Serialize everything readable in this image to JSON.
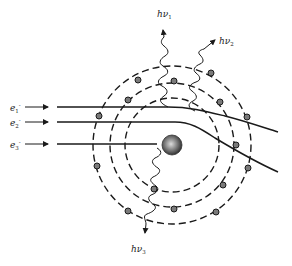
{
  "diagram": {
    "nucleus": {
      "cx": 172,
      "cy": 145,
      "r": 10
    },
    "orbits": [
      {
        "name": "inner-orbit",
        "r": 47
      },
      {
        "name": "middle-orbit",
        "r": 62
      },
      {
        "name": "outer-orbit",
        "r": 79
      }
    ],
    "orbital_electrons": [
      {
        "x": 138,
        "y": 80
      },
      {
        "x": 174,
        "y": 81
      },
      {
        "x": 211,
        "y": 73
      },
      {
        "x": 128,
        "y": 100
      },
      {
        "x": 220,
        "y": 102
      },
      {
        "x": 99,
        "y": 116
      },
      {
        "x": 247,
        "y": 117
      },
      {
        "x": 236,
        "y": 145
      },
      {
        "x": 97,
        "y": 166
      },
      {
        "x": 248,
        "y": 168
      },
      {
        "x": 154,
        "y": 189
      },
      {
        "x": 223,
        "y": 185
      },
      {
        "x": 128,
        "y": 211
      },
      {
        "x": 174,
        "y": 209
      },
      {
        "x": 216,
        "y": 212
      }
    ],
    "incident_electrons": [
      {
        "label": "e",
        "sub": "1",
        "sup": "-",
        "y": 107
      },
      {
        "label": "e",
        "sub": "2",
        "sup": "-",
        "y": 122
      },
      {
        "label": "e",
        "sub": "3",
        "sup": "-",
        "y": 144
      }
    ],
    "photons": [
      {
        "label": "hν",
        "sub": "1"
      },
      {
        "label": "hν",
        "sub": "2"
      },
      {
        "label": "hν",
        "sub": "3"
      }
    ],
    "colors": {
      "line": "#1a1a1a",
      "electron_fill": "#7a7a7a",
      "nucleus_dark": "#2a2a2a",
      "nucleus_light": "#d8d8d8"
    }
  }
}
